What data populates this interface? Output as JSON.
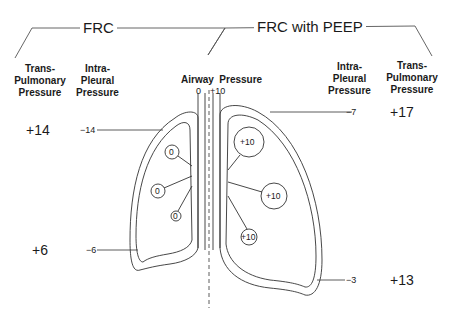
{
  "titles": {
    "left": "FRC",
    "right": "FRC with PEEP"
  },
  "headers": {
    "left_transpulmonary": [
      "Trans-",
      "Pulmonary",
      "Pressure"
    ],
    "left_intrapleural": [
      "Intra-",
      "Pleural",
      "Pressure"
    ],
    "airway_pressure": "Airway  Pressure",
    "right_intrapleural": [
      "Intra-",
      "Pleural",
      "Pressure"
    ],
    "right_transpulmonary": [
      "Trans-",
      "Pulmonary",
      "Pressure"
    ]
  },
  "airway_values": {
    "left": "0",
    "right": "+10"
  },
  "frc": {
    "apex": {
      "transpulmonary": "+14",
      "intrapleural": "−14"
    },
    "base": {
      "transpulmonary": "+6",
      "intrapleural": "−6"
    },
    "alveoli": [
      "0",
      "0",
      "0"
    ]
  },
  "frc_with_peep": {
    "apex": {
      "transpulmonary": "+17",
      "intrapleural": "−7"
    },
    "base": {
      "transpulmonary": "+13",
      "intrapleural": "−3"
    },
    "alveoli": [
      "+10",
      "+10",
      "+10"
    ]
  }
}
